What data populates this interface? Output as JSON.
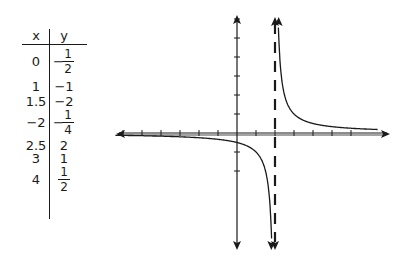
{
  "table": {
    "headers": [
      "x",
      "y"
    ],
    "rows": [
      {
        "x": "0",
        "y": "-1/2",
        "y_sign": "−",
        "y_num": "1",
        "y_den": "2",
        "fraction": true
      },
      {
        "x": "1",
        "y": "−1",
        "fraction": false
      },
      {
        "x": "1.5",
        "y": "−2",
        "fraction": false
      },
      {
        "x": "−2",
        "y": "-1/4",
        "y_sign": "−",
        "y_num": "1",
        "y_den": "4",
        "fraction": true
      },
      {
        "x": "2.5",
        "y": "2",
        "fraction": false
      },
      {
        "x": "3",
        "y": "1",
        "fraction": false
      },
      {
        "x": "4",
        "y": "1/2",
        "y_sign": "",
        "y_num": "1",
        "y_den": "2",
        "fraction": true
      }
    ]
  },
  "chart_data": {
    "type": "line",
    "title": "",
    "function": "y = 1/(x - 2)",
    "xlabel": "",
    "ylabel": "",
    "xlim": [
      -6.5,
      7.5
    ],
    "ylim": [
      -6.5,
      7
    ],
    "grid": false,
    "vertical_asymptote": {
      "x": 2,
      "style": "dashed"
    },
    "horizontal_asymptote": {
      "y": 0
    },
    "x_ticks": [
      -6,
      -5,
      -4,
      -3,
      -2,
      -1,
      1,
      2,
      3,
      4,
      5,
      6
    ],
    "y_ticks": [
      -2,
      -1,
      1,
      2,
      3,
      4,
      5,
      6
    ],
    "tick_labels": "none",
    "series": [
      {
        "name": "left branch",
        "x": [
          -6,
          -2,
          0,
          1,
          1.5,
          1.85
        ],
        "y": [
          -0.125,
          -0.25,
          -0.5,
          -1,
          -2,
          -6.67
        ]
      },
      {
        "name": "right branch",
        "x": [
          2.15,
          2.5,
          3,
          4,
          6,
          7.5
        ],
        "y": [
          6.67,
          2,
          1,
          0.5,
          0.25,
          0.18
        ]
      }
    ],
    "table_points": [
      {
        "x": 0,
        "y": -0.5
      },
      {
        "x": 1,
        "y": -1
      },
      {
        "x": 1.5,
        "y": -2
      },
      {
        "x": -2,
        "y": -0.25
      },
      {
        "x": 2.5,
        "y": 2
      },
      {
        "x": 3,
        "y": 1
      },
      {
        "x": 4,
        "y": 0.5
      }
    ]
  },
  "colors": {
    "ink": "#1a1a1a",
    "background": "#ffffff"
  }
}
